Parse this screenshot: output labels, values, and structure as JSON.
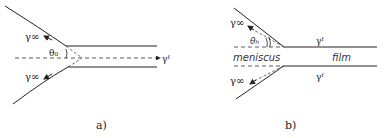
{
  "panels": [
    {
      "id": "a",
      "caption": "a)",
      "labels": {
        "gamma_inf_top": "γ∞",
        "gamma_inf_bottom": "γ∞",
        "theta": "θ₀",
        "gamma_f": "γᶠ"
      }
    },
    {
      "id": "b",
      "caption": "b)",
      "labels": {
        "gamma_inf_top": "γ∞",
        "gamma_inf_bottom": "γ∞",
        "theta": "θₕ",
        "gamma_f_top": "γᶠ",
        "gamma_f_bottom": "γᶠ",
        "meniscus": "meniscus",
        "film": "film"
      }
    }
  ],
  "colors": {
    "line": "#222222",
    "background": "#ffffff"
  }
}
